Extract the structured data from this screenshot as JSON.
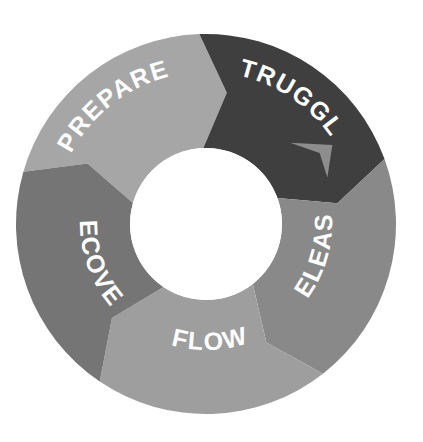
{
  "canvas": {
    "width": 423,
    "height": 442,
    "background": "#ffffff"
  },
  "diagram": {
    "title": "",
    "type": "cyclical-donut-process",
    "center_x": 206,
    "center_y": 224,
    "outer_radius": 190,
    "inner_radius": 76,
    "hole_color": "#ffffff",
    "label_color": "#ffffff",
    "direction": "clockwise",
    "segment_count": 5
  },
  "chart_data": {
    "type": "pie",
    "title": "",
    "xlabel": "",
    "ylabel": "",
    "legend": "none",
    "grid": false,
    "categories": [
      "PREPARE",
      "STRUGGLE",
      "RELEASE",
      "FLOW",
      "RECOVER"
    ],
    "values": [
      72,
      72,
      72,
      72,
      72
    ],
    "colors": [
      "#a6a6a6",
      "#3f3f3f",
      "#898989",
      "#9e9e9e",
      "#757575"
    ],
    "annotations": [
      "clockwise-arrow-release-to-struggle"
    ]
  },
  "segments": [
    {
      "id": "prepare",
      "label": "PREPARE",
      "color": "#a6a6a6",
      "start_angle": -74,
      "end_angle": -2,
      "label_radius": 152,
      "label_angle": -38
    },
    {
      "id": "struggle",
      "label": "STRUGGLE",
      "color": "#3f3f3f",
      "start_angle": -2,
      "end_angle": 70,
      "label_radius": 152,
      "label_angle": 34
    },
    {
      "id": "release",
      "label": "RELEASE",
      "color": "#898989",
      "start_angle": 70,
      "end_angle": 142,
      "label_radius": 152,
      "label_angle": 106
    },
    {
      "id": "flow",
      "label": "FLOW",
      "color": "#9e9e9e",
      "start_angle": 142,
      "end_angle": 214,
      "label_radius": 152,
      "label_angle": 178
    },
    {
      "id": "recover",
      "label": "RECOVER",
      "color": "#757575",
      "start_angle": 214,
      "end_angle": 286,
      "label_radius": 152,
      "label_angle": 250
    }
  ],
  "arrow_marker": {
    "id": "release-to-struggle-arrow",
    "fill": "#8d8d8d",
    "angle": 62
  }
}
